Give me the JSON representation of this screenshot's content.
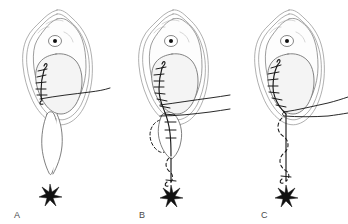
{
  "figure": {
    "background_color": "#ffffff",
    "width": 348,
    "height": 224,
    "panel_count": 3
  },
  "colors": {
    "contour_outer": "#8d8d8d",
    "contour_mid": "#7c7c7c",
    "inner_fill": "#f4f4f4",
    "suture_black": "#1a1a1a",
    "label_gray": "#4a4a4a",
    "hairline_gray": "#b4b4b4",
    "page_background": "#ffffff"
  },
  "panels": [
    {
      "id": "panel-a",
      "label": "A",
      "caption_label": "A",
      "stage": 1,
      "features": [
        "outer-contour",
        "mid-contour",
        "inner-body",
        "eye-marker",
        "suture-ladder-short",
        "needle-thread-single",
        "open-lens-defect",
        "star-marker"
      ],
      "suture_rung_count": 5,
      "thread_line_count": 1,
      "dashed_outline": false,
      "lens_open": true
    },
    {
      "id": "panel-b",
      "label": "B",
      "caption_label": "B",
      "stage": 2,
      "features": [
        "outer-contour",
        "mid-contour",
        "inner-body",
        "eye-marker",
        "suture-ladder-long",
        "needle-thread-double",
        "dashed-flap-left",
        "closing-lens-defect",
        "descending-suture-tail",
        "star-marker"
      ],
      "suture_rung_count": 11,
      "thread_line_count": 2,
      "dashed_outline": true,
      "lens_open": true
    },
    {
      "id": "panel-c",
      "label": "C",
      "caption_label": "C",
      "stage": 3,
      "features": [
        "outer-contour",
        "mid-contour",
        "inner-body",
        "eye-marker",
        "suture-ladder-short",
        "needle-pointed",
        "dashed-snake-column",
        "closed-vertical-seam",
        "star-marker"
      ],
      "suture_rung_count": 7,
      "thread_line_count": 2,
      "dashed_outline": true,
      "lens_open": false
    }
  ],
  "markers": {
    "eye_marker_name": "central-dot-marker",
    "star_marker_name": "star-marker",
    "star_glyph": "star"
  }
}
